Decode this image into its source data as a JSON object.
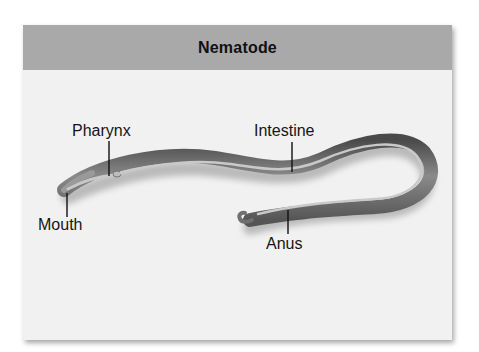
{
  "figure": {
    "title": "Nematode",
    "colors": {
      "header": "#a9a9a9",
      "panel": "#f1f1f1",
      "worm": "#6f6f6f",
      "label_text": "#151515"
    },
    "labels": [
      {
        "id": "pharynx",
        "text": "Pharynx"
      },
      {
        "id": "intestine",
        "text": "Intestine"
      },
      {
        "id": "mouth",
        "text": "Mouth"
      },
      {
        "id": "anus",
        "text": "Anus"
      }
    ]
  }
}
